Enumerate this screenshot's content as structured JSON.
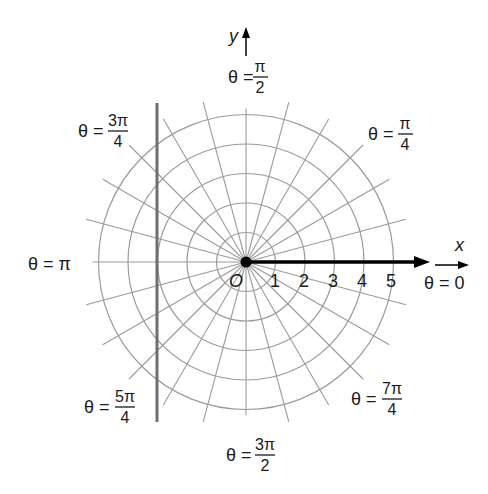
{
  "diagram": {
    "type": "polar-grid",
    "center": {
      "x": 246,
      "y": 262
    },
    "unit_radius_px": 29.5,
    "circles": [
      1,
      2,
      3,
      4,
      5
    ],
    "spoke_step_degrees": 15,
    "colors": {
      "grid": "#9a9a9a",
      "polar_axis": "#000000",
      "vertical_line": "#6f6f6f",
      "text": "#1a1a1a"
    },
    "axes": {
      "x_label": "x",
      "y_label": "y",
      "origin_label": "O",
      "ticks": [
        "1",
        "2",
        "3",
        "4",
        "5"
      ]
    },
    "angle_labels": {
      "theta_0": {
        "prefix": "θ = ",
        "value": "0"
      },
      "theta_pi_4": {
        "prefix": "θ = ",
        "num": "π",
        "den": "4"
      },
      "theta_pi_2": {
        "prefix": "θ = ",
        "num": "π",
        "den": "2"
      },
      "theta_3pi_4": {
        "prefix": "θ = ",
        "num": "3π",
        "den": "4"
      },
      "theta_pi": {
        "prefix": "θ = ",
        "value": "π"
      },
      "theta_5pi_4": {
        "prefix": "θ = ",
        "num": "5π",
        "den": "4"
      },
      "theta_3pi_2": {
        "prefix": "θ = ",
        "num": "3π",
        "den": "2"
      },
      "theta_7pi_4": {
        "prefix": "θ = ",
        "num": "7π",
        "den": "4"
      }
    },
    "vertical_line": {
      "x": 157,
      "y_top": 103,
      "y_bottom": 422
    }
  }
}
